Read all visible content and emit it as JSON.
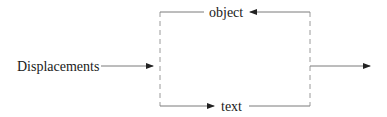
{
  "diagram": {
    "input_label": "Displacements",
    "top_branch_label": "object",
    "bottom_branch_label": "text",
    "colors": {
      "line": "#7a7a7a",
      "dashed_line": "#9a9a9a",
      "arrowhead": "#222222",
      "text": "#1a1a1a",
      "background": "#ffffff"
    }
  }
}
